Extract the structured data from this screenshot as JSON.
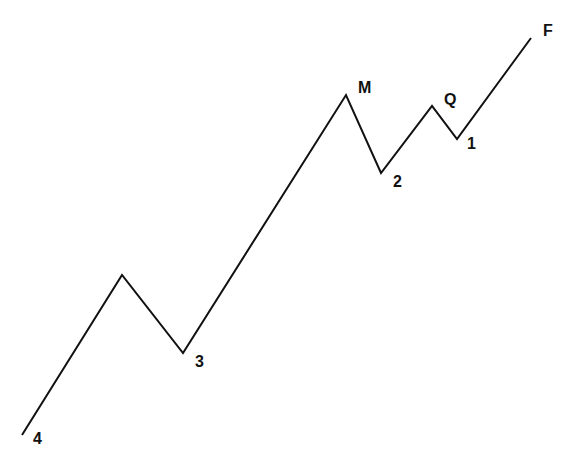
{
  "diagram": {
    "title": "",
    "line_color": "#111111",
    "line_width": 2,
    "points": [
      {
        "x": 22,
        "y": 435
      },
      {
        "x": 122,
        "y": 275
      },
      {
        "x": 183,
        "y": 353
      },
      {
        "x": 346,
        "y": 95
      },
      {
        "x": 381,
        "y": 173
      },
      {
        "x": 432,
        "y": 106
      },
      {
        "x": 457,
        "y": 139
      },
      {
        "x": 531,
        "y": 38
      }
    ],
    "labels": [
      {
        "id": "4",
        "text": "4",
        "x": 33,
        "y": 431
      },
      {
        "id": "3",
        "text": "3",
        "x": 195,
        "y": 354
      },
      {
        "id": "M",
        "text": "M",
        "x": 358,
        "y": 80
      },
      {
        "id": "2",
        "text": "2",
        "x": 393,
        "y": 174
      },
      {
        "id": "Q",
        "text": "Q",
        "x": 444,
        "y": 92
      },
      {
        "id": "1",
        "text": "1",
        "x": 467,
        "y": 136
      },
      {
        "id": "F",
        "text": "F",
        "x": 543,
        "y": 23
      }
    ]
  }
}
